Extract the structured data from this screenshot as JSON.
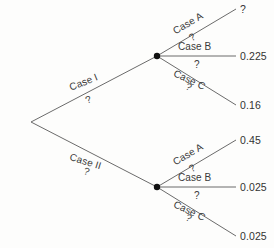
{
  "diagram": {
    "type": "probability-tree",
    "background_color": "#fdfdfc",
    "line_color": "#6b6b6b",
    "node_color": "#111111",
    "text_color": "#3a3a3a",
    "unknown_symbol": "?",
    "nodes": {
      "root": {
        "name": "root-node",
        "x": 31,
        "y": 122
      },
      "case_i": {
        "name": "case-i-node",
        "x": 157,
        "y": 56
      },
      "case_ii": {
        "name": "case-ii-node",
        "x": 157,
        "y": 187
      }
    },
    "first_level": [
      {
        "label": "Case I",
        "probability": "?",
        "to": "case_i"
      },
      {
        "label": "Case II",
        "probability": "?",
        "to": "case_ii"
      }
    ],
    "second_level_case_i": [
      {
        "label": "Case A",
        "probability": "?",
        "outcome": "?"
      },
      {
        "label": "Case B",
        "probability": "?",
        "outcome": "0.225"
      },
      {
        "label": "Case C",
        "probability": "?",
        "outcome": "0.16"
      }
    ],
    "second_level_case_ii": [
      {
        "label": "Case A",
        "probability": "?",
        "outcome": "0.45"
      },
      {
        "label": "Case B",
        "probability": "?",
        "outcome": "0.025"
      },
      {
        "label": "Case C",
        "probability": "?",
        "outcome": "0.025"
      }
    ]
  }
}
